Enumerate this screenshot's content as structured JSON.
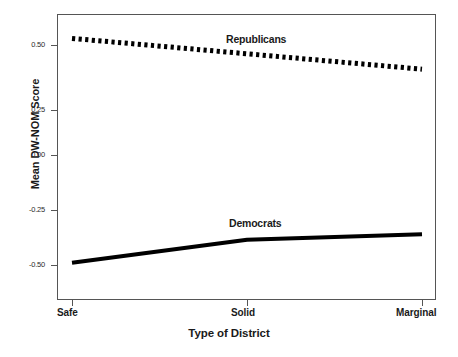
{
  "chart_data": {
    "type": "line",
    "title": "",
    "xlabel": "Type of District",
    "ylabel": "Mean DW-NOM Score",
    "categories": [
      "Safe",
      "Solid",
      "Marginal"
    ],
    "ylim": [
      -0.75,
      0.75
    ],
    "yticks": [
      0.5,
      0.25,
      0.0,
      -0.25,
      -0.5
    ],
    "ytick_labels": [
      "0.50",
      "0.25",
      "0.00",
      "-0.25",
      "-0.50"
    ],
    "xtick_labels": [
      "Safe",
      "Solid",
      "Marginal"
    ],
    "grid": false,
    "legend": "inline-annotations",
    "series": [
      {
        "name": "Republicans",
        "values": [
          0.53,
          0.46,
          0.39
        ],
        "style": "dotted",
        "color": "#000000",
        "annotation": "Republicans"
      },
      {
        "name": "Democrats",
        "values": [
          -0.49,
          -0.385,
          -0.36
        ],
        "style": "solid",
        "color": "#000000",
        "annotation": "Democrats"
      }
    ]
  },
  "axes": {
    "y_title": "Mean DW-NOM Score",
    "x_title": "Type of District",
    "y_tick_labels": [
      "0.50",
      "0.25",
      "0.00",
      "-0.25",
      "-0.50"
    ],
    "x_tick_labels": [
      "Safe",
      "Solid",
      "Marginal"
    ]
  },
  "annotations": {
    "republicans": "Republicans",
    "democrats": "Democrats"
  },
  "caption": {
    "text": ""
  },
  "colors": {
    "frame": "#555555",
    "series_line": "#000000",
    "background": "#ffffff"
  }
}
